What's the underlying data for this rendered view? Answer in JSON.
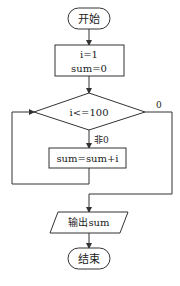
{
  "flowchart": {
    "start": {
      "label": "开始"
    },
    "init": {
      "line1": "i=1",
      "line2": "sum=0"
    },
    "decision": {
      "label": "i<=100"
    },
    "branch_true": {
      "label": "非0"
    },
    "branch_false": {
      "label": "0"
    },
    "loop_body": {
      "label": "sum=sum+i"
    },
    "output": {
      "label": "输出sum"
    },
    "end": {
      "label": "结束"
    }
  },
  "colors": {
    "stroke": "#333333",
    "background": "#ffffff",
    "text": "#222222"
  }
}
